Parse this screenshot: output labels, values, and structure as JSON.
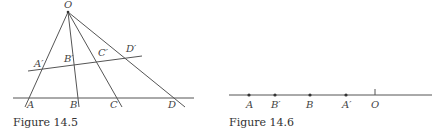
{
  "figure_14_5": {
    "caption": "Figure 14.5",
    "labels": {
      "O": "O",
      "A": "A",
      "B": "B",
      "C": "C",
      "D": "D",
      "A_prime": "A′",
      "B_prime": "B′",
      "C_prime": "C′",
      "D_prime": "D′"
    }
  },
  "figure_14_6": {
    "caption": "Figure 14.6",
    "labels": {
      "A": "A",
      "B_prime": "B′",
      "B": "B",
      "A_prime": "A′",
      "O": "O"
    }
  }
}
